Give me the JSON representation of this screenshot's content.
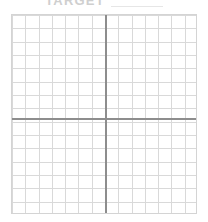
{
  "header": {
    "title": "TARGET",
    "blank_line_label": "",
    "title_color": "#cfcfcf"
  },
  "grid": {
    "columns": 14,
    "rows": 15,
    "cell_width": 13.28,
    "cell_height": 13.33,
    "left": 11,
    "top": 14,
    "width": 186,
    "height": 200,
    "minor_line_color": "#d9d9d9",
    "border_color": "#d4d4d4",
    "background_color": "#ffffff"
  },
  "axes": {
    "axis_color": "#8d8d8d",
    "axis_thickness": 2,
    "origin_x": 93,
    "origin_y": 103,
    "x_axis_label": "",
    "y_axis_label": ""
  },
  "quadrants": [
    {
      "name": "quadrant-i",
      "label": ""
    },
    {
      "name": "quadrant-ii",
      "label": ""
    },
    {
      "name": "quadrant-iii",
      "label": ""
    },
    {
      "name": "quadrant-iv",
      "label": ""
    }
  ],
  "chart_data": {
    "type": "scatter",
    "title": "TARGET",
    "xlabel": "",
    "ylabel": "",
    "x": [],
    "y": [],
    "series": [],
    "xlim": [
      -7,
      7
    ],
    "ylim": [
      -7.5,
      7.5
    ],
    "grid": true,
    "legend": "none"
  }
}
